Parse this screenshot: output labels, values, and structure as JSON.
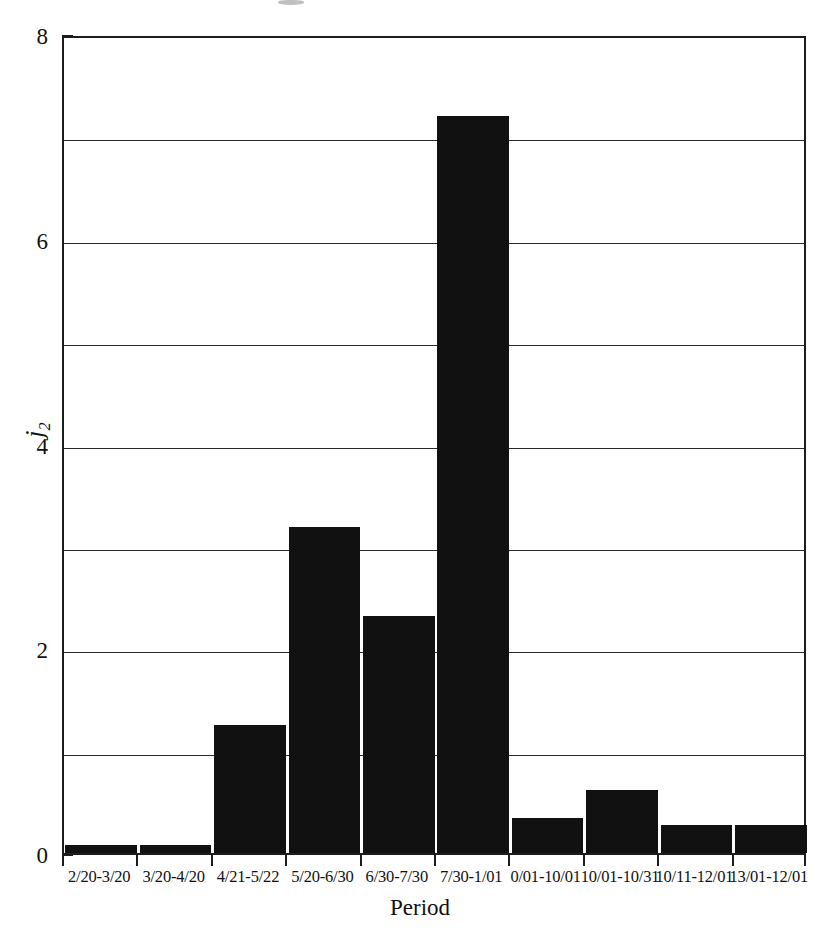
{
  "chart_data": {
    "type": "bar",
    "title": "",
    "subtitle": "",
    "xlabel": "Period",
    "ylabel": "j2",
    "ylabel_display": "j",
    "ylabel_sub": "2",
    "categories": [
      "2/20-3/20",
      "3/20-4/20",
      "4/21-5/22",
      "5/20-6/30",
      "6/30-7/30",
      "7/30-1/01",
      "0/01-10/01",
      "10/01-10/31",
      "10/11-12/01",
      "13/01-12/01"
    ],
    "values": [
      0.08,
      0.08,
      1.25,
      3.18,
      2.32,
      7.2,
      0.34,
      0.62,
      0.27,
      0.27
    ],
    "ylim": [
      0,
      8
    ],
    "xlim": [
      0,
      10
    ],
    "y_ticks": [
      0,
      2,
      4,
      6,
      8
    ],
    "y_ticklabels": [
      "0",
      "2",
      "4",
      "6",
      "8"
    ],
    "y_minor_ticks": [
      1,
      3,
      5,
      7
    ],
    "gridlines_y": [
      1,
      2,
      3,
      4,
      5,
      6,
      7
    ],
    "grid": true,
    "grid_axis": "y",
    "legend": false,
    "legend_position": "none",
    "bar_color": "#111111",
    "frame_color": "#1c1c1c",
    "background_color": "#ffffff",
    "bar_width_fraction": 0.96
  },
  "figure": {
    "plot_left": 62,
    "plot_top": 36,
    "plot_width": 744,
    "plot_height": 819
  }
}
